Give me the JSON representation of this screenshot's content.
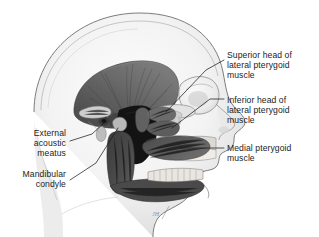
{
  "figure": {
    "background_color": "#ffffff",
    "ink_color": "#1d1d1d",
    "width": 319,
    "height": 237,
    "artist_signature": "JH"
  },
  "labels": {
    "superior_head": {
      "text": "Superior head of\nlateral pterygoid\nmuscle",
      "side": "right"
    },
    "inferior_head": {
      "text": "Inferior head of\nlateral pterygoid\nmuscle",
      "side": "right"
    },
    "medial_pterygoid": {
      "text": "Medial pterygoid\nmuscle",
      "side": "right"
    },
    "external_acoustic_meatus": {
      "text": "External\nacoustic\nmeatus",
      "side": "left"
    },
    "mandibular_condyle": {
      "text": "Mandibular\ncondyle",
      "side": "left"
    }
  },
  "structures": {
    "cranium": "skull-vault",
    "temporalis": "temporalis-muscle",
    "zygomatic_arch": "zygomatic-arch",
    "orbit": "orbital-cavity",
    "nasal": "nasal-profile",
    "maxilla": "maxilla",
    "mandible": "mandible-ramus-and-body",
    "infratemporal_fossa": "infratemporal-fossa"
  }
}
